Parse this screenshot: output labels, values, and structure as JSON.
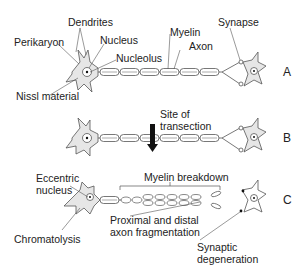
{
  "panels": [
    {
      "id": "A",
      "label": "A"
    },
    {
      "id": "B",
      "label": "B"
    },
    {
      "id": "C",
      "label": "C"
    }
  ],
  "labels": {
    "dendrites": "Dendrites",
    "perikaryon": "Perikaryon",
    "nucleus": "Nucleus",
    "nucleolus": "Nucleolus",
    "nissl": "Nissl material",
    "myelin": "Myelin",
    "axon": "Axon",
    "synapse": "Synapse",
    "site_line1": "Site of",
    "site_line2": "transection",
    "eccentric_line1": "Eccentric",
    "eccentric_line2": "nucleus",
    "chromatolysis": "Chromatolysis",
    "myelin_breakdown": "Myelin breakdown",
    "fragmentation_line1": "Proximal and distal",
    "fragmentation_line2": "axon fragmentation",
    "synaptic_line1": "Synaptic",
    "synaptic_line2": "degeneration"
  },
  "colors": {
    "stroke": "#555555",
    "cell_fill": "#e6e6e6",
    "arrow": "#111111",
    "text": "#222222"
  }
}
